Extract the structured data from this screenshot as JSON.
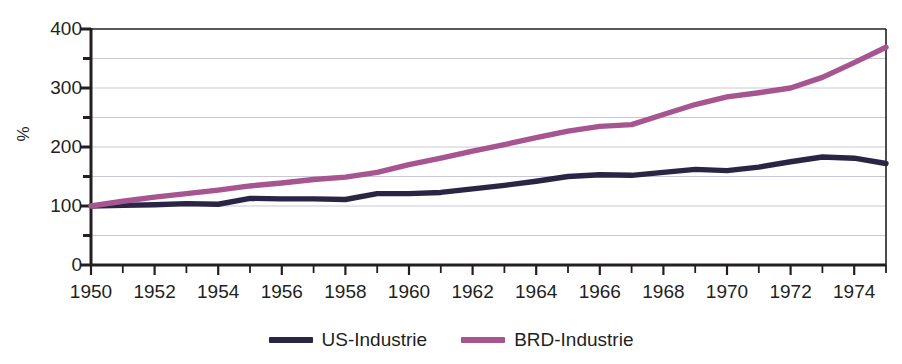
{
  "chart_data": {
    "type": "line",
    "title": "",
    "subtitle": "",
    "xlabel": "",
    "ylabel": "%",
    "xlim": [
      1950,
      1975
    ],
    "ylim": [
      0,
      400
    ],
    "grid": true,
    "grid_interval": 50,
    "legend_position": "bottom-center",
    "x": [
      1950,
      1951,
      1952,
      1953,
      1954,
      1955,
      1956,
      1957,
      1958,
      1959,
      1960,
      1961,
      1962,
      1963,
      1964,
      1965,
      1966,
      1967,
      1968,
      1969,
      1970,
      1971,
      1972,
      1973,
      1974,
      1975
    ],
    "x_tick_labels": [
      "1950",
      "1952",
      "1954",
      "1956",
      "1958",
      "1960",
      "1962",
      "1964",
      "1966",
      "1968",
      "1970",
      "1972",
      "1974"
    ],
    "y_tick_labels": [
      "400",
      "300",
      "200",
      "100",
      "0"
    ],
    "series": [
      {
        "name": "US-Industrie",
        "color": "#2b2545",
        "values": [
          100,
          101,
          102,
          104,
          103,
          113,
          112,
          112,
          111,
          121,
          121,
          123,
          129,
          135,
          142,
          150,
          153,
          152,
          157,
          162,
          160,
          166,
          175,
          183,
          181,
          172
        ]
      },
      {
        "name": "BRD-Industrie",
        "color": "#a65591",
        "values": [
          100,
          108,
          115,
          121,
          127,
          134,
          139,
          145,
          149,
          157,
          170,
          181,
          193,
          204,
          216,
          227,
          235,
          238,
          255,
          272,
          285,
          292,
          300,
          318,
          343,
          369
        ]
      }
    ]
  },
  "legend": {
    "items": [
      {
        "label": "US-Industrie",
        "color": "#2b2545"
      },
      {
        "label": "BRD-Industrie",
        "color": "#a65591"
      }
    ]
  },
  "axes": {
    "y_label": "%"
  },
  "colors": {
    "axis": "#231f20",
    "grid": "#c8c8d8",
    "background": "#ffffff"
  }
}
